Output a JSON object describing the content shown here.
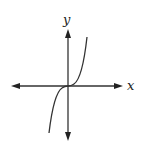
{
  "figure": {
    "axes": {
      "x_label": "x",
      "y_label": "y"
    },
    "stroke_color": "#333333",
    "background_color": "#ffffff"
  }
}
